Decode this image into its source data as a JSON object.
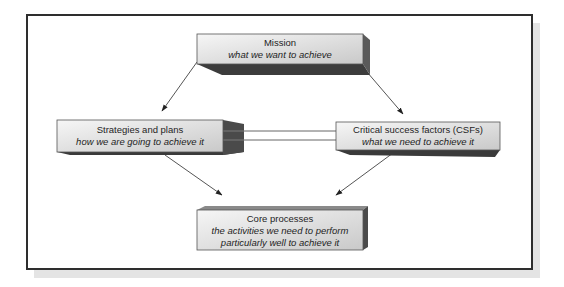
{
  "diagram": {
    "type": "flow-diagram",
    "nodes": {
      "mission": {
        "title": "Mission",
        "subtitle": "what we want to achieve"
      },
      "strategies": {
        "title": "Strategies and plans",
        "subtitle": "how we are going to achieve it"
      },
      "csfs": {
        "title": "Critical success factors (CSFs)",
        "subtitle": "what we need to achieve it"
      },
      "core": {
        "title": "Core processes",
        "subtitle_line1": "the activities we need to perform",
        "subtitle_line2": "particularly well to achieve it"
      }
    },
    "edges": [
      {
        "from": "Mission",
        "to": "Strategies and plans",
        "type": "arrow"
      },
      {
        "from": "Mission",
        "to": "Critical success factors (CSFs)",
        "type": "arrow"
      },
      {
        "from": "Strategies and plans",
        "to": "Critical success factors (CSFs)",
        "type": "double-line"
      },
      {
        "from": "Strategies and plans",
        "to": "Core processes",
        "type": "arrow"
      },
      {
        "from": "Critical success factors (CSFs)",
        "to": "Core processes",
        "type": "arrow"
      }
    ],
    "colors": {
      "box_face_light": "#f2f2f2",
      "box_face_dark": "#cfcfcf",
      "box_side": "#4a4a4a",
      "box_bottom": "#3a3a3a",
      "frame_border": "#2e2e2e",
      "frame_shadow": "#e4e4e4",
      "line": "#555555"
    }
  }
}
